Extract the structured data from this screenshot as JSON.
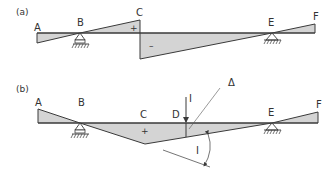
{
  "colors": {
    "fill": "#d4d4d4",
    "stroke": "#3a3a3a",
    "text": "#333333",
    "background": "#ffffff"
  },
  "panel_a": {
    "label": "(a)",
    "points": {
      "A": "A",
      "B": "B",
      "C": "C",
      "E": "E",
      "F": "F"
    },
    "signs": {
      "positive": "+",
      "negative": "–"
    }
  },
  "panel_b": {
    "label": "(b)",
    "points": {
      "A": "A",
      "B": "B",
      "C": "C",
      "D": "D",
      "E": "E",
      "F": "F"
    },
    "signs": {
      "positive": "+"
    },
    "load_label": "I",
    "angle_label": "I",
    "delta_label": "Δ"
  }
}
